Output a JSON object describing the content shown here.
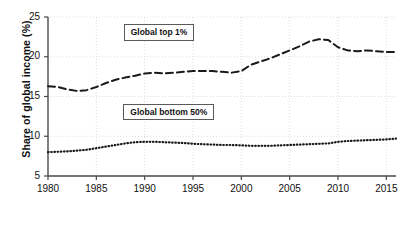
{
  "chart_data": {
    "type": "line",
    "title": "",
    "xlabel": "",
    "ylabel": "Share of global income (%)",
    "xlim": [
      1980,
      2016
    ],
    "ylim": [
      5,
      25
    ],
    "grid": true,
    "legend_position": "inline-boxed-labels",
    "yticks": [
      5,
      10,
      15,
      20,
      25
    ],
    "ytick_labels": [
      "5",
      "10",
      "15",
      "20",
      "25"
    ],
    "xticks": [
      1980,
      1985,
      1990,
      1995,
      2000,
      2005,
      2010,
      2015
    ],
    "xtick_labels": [
      "1980",
      "1985",
      "1990",
      "1995",
      "2000",
      "2005",
      "2010",
      "2015"
    ],
    "x": [
      1980,
      1981,
      1982,
      1983,
      1984,
      1985,
      1986,
      1987,
      1988,
      1989,
      1990,
      1991,
      1992,
      1993,
      1994,
      1995,
      1996,
      1997,
      1998,
      1999,
      2000,
      2001,
      2002,
      2003,
      2004,
      2005,
      2006,
      2007,
      2008,
      2009,
      2010,
      2011,
      2012,
      2013,
      2014,
      2015,
      2016
    ],
    "series": [
      {
        "name": "Global top 1%",
        "style": "dashed",
        "color": "#1a1a1a",
        "values": [
          16.3,
          16.2,
          15.9,
          15.7,
          15.8,
          16.2,
          16.7,
          17.1,
          17.4,
          17.6,
          17.9,
          18.0,
          17.9,
          18.0,
          18.1,
          18.2,
          18.2,
          18.2,
          18.1,
          18.0,
          18.2,
          19.0,
          19.4,
          19.8,
          20.3,
          20.8,
          21.3,
          21.9,
          22.2,
          22.1,
          21.2,
          20.8,
          20.7,
          20.8,
          20.7,
          20.6,
          20.6
        ]
      },
      {
        "name": "Global bottom 50%",
        "style": "dotted",
        "color": "#1a1a1a",
        "values": [
          8.0,
          8.05,
          8.1,
          8.2,
          8.3,
          8.5,
          8.7,
          8.9,
          9.1,
          9.25,
          9.3,
          9.3,
          9.25,
          9.2,
          9.15,
          9.05,
          9.0,
          8.95,
          8.9,
          8.9,
          8.85,
          8.8,
          8.8,
          8.8,
          8.85,
          8.9,
          8.95,
          9.0,
          9.05,
          9.1,
          9.3,
          9.4,
          9.45,
          9.5,
          9.55,
          9.6,
          9.7
        ]
      }
    ],
    "annotations": [
      {
        "text": "Global top 1%",
        "x": 1991.5,
        "y": 23.0
      },
      {
        "text": "Global bottom 50%",
        "x": 1992.5,
        "y": 13.0
      }
    ]
  }
}
